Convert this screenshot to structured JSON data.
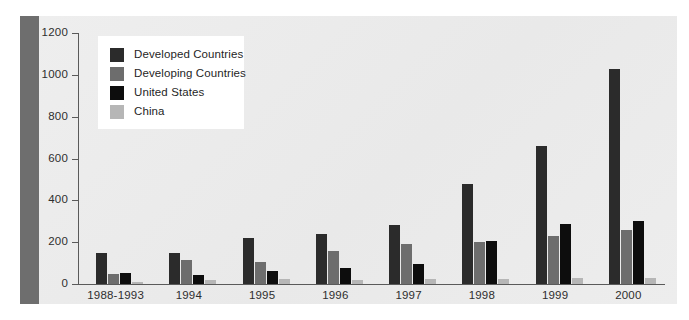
{
  "chart_data": {
    "type": "bar",
    "title": "",
    "subtitle": "",
    "xlabel": "",
    "ylabel": "",
    "ylim": [
      0,
      1200
    ],
    "yticks": [
      0,
      200,
      400,
      600,
      800,
      1000,
      1200
    ],
    "grid": false,
    "legend_position": "top-left",
    "categories": [
      "1988-1993",
      "1994",
      "1995",
      "1996",
      "1997",
      "1998",
      "1999",
      "2000"
    ],
    "series": [
      {
        "name": "Developed Countries",
        "color": "#2b2b2b",
        "values": [
          150,
          150,
          218,
          240,
          282,
          480,
          660,
          1030
        ]
      },
      {
        "name": "Developing Countries",
        "color": "#6d6d6d",
        "values": [
          50,
          115,
          105,
          160,
          190,
          200,
          230,
          260
        ]
      },
      {
        "name": "United States",
        "color": "#0d0d0d",
        "values": [
          52,
          45,
          60,
          75,
          95,
          205,
          285,
          300
        ]
      },
      {
        "name": "China",
        "color": "#b6b6b6",
        "values": [
          12,
          20,
          25,
          20,
          25,
          25,
          30,
          30
        ]
      }
    ]
  },
  "legend": {
    "entries": [
      {
        "label": "Developed Countries",
        "color": "#2b2b2b"
      },
      {
        "label": "Developing Countries",
        "color": "#6d6d6d"
      },
      {
        "label": "United States",
        "color": "#0d0d0d"
      },
      {
        "label": "China",
        "color": "#b6b6b6"
      }
    ]
  },
  "axis": {
    "y_tick_labels": [
      "1200",
      "1000",
      "800",
      "600",
      "400",
      "200",
      "0"
    ],
    "x_tick_labels": [
      "1988-1993",
      "1994",
      "1995",
      "1996",
      "1997",
      "1998",
      "1999",
      "2000"
    ]
  },
  "colors": {
    "panel_background": "#ececec",
    "left_band": "#6e6e6e",
    "axis_line": "#5a5a5a",
    "text": "#2e2e2e",
    "legend_background": "#ffffff"
  }
}
